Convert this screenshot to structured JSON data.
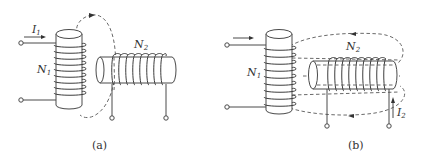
{
  "figure": {
    "type": "physics-diagram"
  },
  "panels": [
    {
      "id": "a",
      "caption": "(a)",
      "primary_coil": {
        "label": "N",
        "subscript": "1",
        "current_label": "I",
        "current_subscript": "1"
      },
      "secondary_coil": {
        "label": "N",
        "subscript": "2"
      },
      "flux_description": "single dashed flux loop from coil 1 partially linking coil 2"
    },
    {
      "id": "b",
      "caption": "(b)",
      "primary_coil": {
        "label": "N",
        "subscript": "1"
      },
      "secondary_coil": {
        "label": "N",
        "subscript": "2",
        "current_label": "I",
        "current_subscript": "2"
      },
      "flux_description": "dashed flux loops from coil 2 linking back through coil 1"
    }
  ]
}
